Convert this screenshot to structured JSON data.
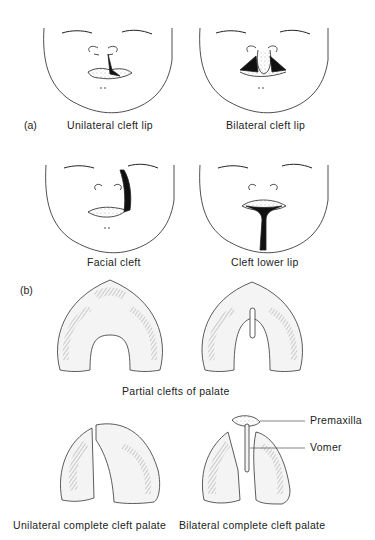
{
  "figure": {
    "panel_a": {
      "tag": "(a)",
      "items": [
        {
          "label": "Unilateral cleft lip"
        },
        {
          "label": "Bilateral cleft lip"
        },
        {
          "label": "Facial cleft"
        },
        {
          "label": "Cleft lower lip"
        }
      ]
    },
    "panel_b": {
      "tag": "(b)",
      "partial_label": "Partial clefts of palate",
      "items": [
        {
          "label": "Unilateral complete cleft palate"
        },
        {
          "label": "Bilateral complete cleft palate"
        }
      ],
      "annotations": [
        {
          "label": "Premaxilla"
        },
        {
          "label": "Vomer"
        }
      ]
    }
  }
}
